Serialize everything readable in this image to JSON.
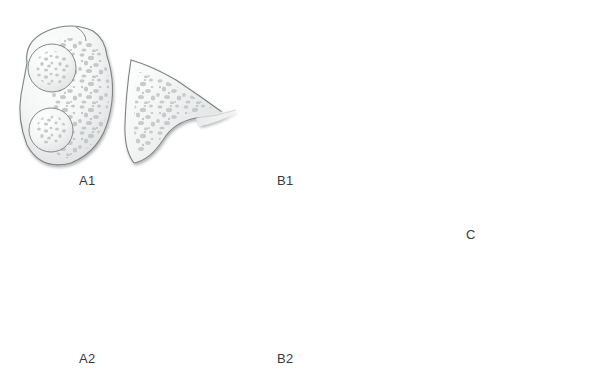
{
  "figure": {
    "background_color": "#ffffff",
    "width": 611,
    "height": 375,
    "label_color": "#3a3a3a"
  },
  "palette": {
    "cortex_light": "#fbfbfb",
    "cortex_mid": "#eceded",
    "cortex_shadow": "#d5d7d8",
    "outline": "#7f8384",
    "outline_dark": "#5d6162",
    "trabecula": "#c3c6c7",
    "trabecula_dark": "#9fa3a4",
    "impaction_dark": "#5a5e5f",
    "impaction_core": "#3c4041"
  },
  "panels": [
    {
      "id": "a1",
      "label": "A1",
      "label_x": 79,
      "label_y": 173,
      "description": "Intact distal radius cross-section with separate undisplaced wedge fragment",
      "fragment_displaced": false,
      "impaction_zone": false
    },
    {
      "id": "b1",
      "label": "B1",
      "label_x": 277,
      "label_y": 173,
      "description": "Wedge fragment rotated and displaced proximally with dark impacted cancellous zone",
      "fragment_displaced": true,
      "impaction_zone": true
    },
    {
      "id": "c",
      "label": "C",
      "label_x": 466,
      "label_y": 227,
      "description": "Reduced fracture, fragment restored in near anatomic position",
      "fragment_displaced": false,
      "impaction_zone": false
    },
    {
      "id": "a2",
      "label": "A2",
      "label_x": 79,
      "label_y": 351,
      "description": "Intact distal radius cross-section with fragment closely apposed",
      "fragment_displaced": false,
      "impaction_zone": false
    },
    {
      "id": "b2",
      "label": "B2",
      "label_x": 277,
      "label_y": 351,
      "description": "Wedge fragment tilted with dense dark impaction at fragment base",
      "fragment_displaced": true,
      "impaction_zone": true
    }
  ]
}
